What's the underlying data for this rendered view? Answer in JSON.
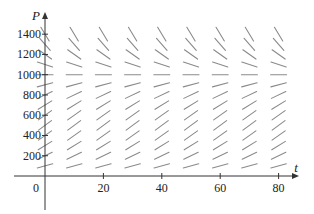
{
  "chart_data": {
    "type": "slope_field",
    "title": "",
    "xlabel": "t",
    "ylabel": "P",
    "origin_label": "0",
    "equation_hint": "dP/dt = kP(1 - P/1000)",
    "k": 0.085,
    "carrying_capacity": 1000,
    "xlim": [
      -10,
      88
    ],
    "ylim": [
      -380,
      1600
    ],
    "x_ticks": [
      20,
      40,
      60,
      80
    ],
    "x_tick_labels": [
      "20",
      "40",
      "60",
      "80"
    ],
    "y_ticks": [
      200,
      400,
      600,
      800,
      1000,
      1200,
      1400
    ],
    "y_tick_labels": [
      "200",
      "400",
      "600",
      "800",
      "1000",
      "1200",
      "1400"
    ],
    "grid": false,
    "t_values": [
      0,
      10,
      20,
      30,
      40,
      50,
      60,
      70,
      80
    ],
    "P_values": [
      100,
      200,
      300,
      400,
      500,
      600,
      700,
      800,
      900,
      1000,
      1100,
      1200,
      1300,
      1400
    ],
    "segment_color": "#8a8a8a",
    "axis_color": "#333333"
  }
}
